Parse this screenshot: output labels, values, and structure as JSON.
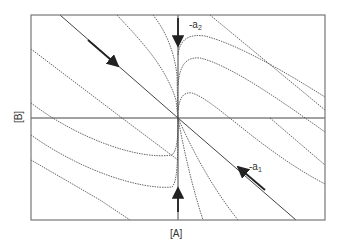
{
  "diagram": {
    "type": "phase-plane",
    "xlabel": "[A]",
    "ylabel": "[B]",
    "eigen_labels": [
      {
        "id": "a2",
        "prefix": "-a",
        "sub": "2"
      },
      {
        "id": "a1",
        "prefix": "-a",
        "sub": "1"
      }
    ],
    "colors": {
      "frame": "#777777",
      "curve": "#555555",
      "arrow": "#222222",
      "background": "#ffffff"
    },
    "frame": {
      "left": 31,
      "top": 15,
      "right": 325,
      "bottom": 220
    },
    "origin": {
      "x": 178,
      "y": 118
    },
    "trajectories": [
      {
        "name": "main-diagonal",
        "d": "M60,15 L178,118 L296,220",
        "style": "solid"
      },
      {
        "name": "upper-left-1",
        "d": "M117,15 C140,40 165,65 176,100 L178,118",
        "style": "dotted"
      },
      {
        "name": "upper-left-2",
        "d": "M153,15 C165,30 174,50 177,75 L178,118",
        "style": "dotted"
      },
      {
        "name": "left-1",
        "d": "M31,49 L122,118 L178,160",
        "style": "dotted"
      },
      {
        "name": "left-2",
        "d": "M31,103 C80,140 140,160 172,155 C177,150 178,140 178,118",
        "style": "dotted"
      },
      {
        "name": "left-3",
        "d": "M31,135 C80,170 140,190 172,187 C177,182 178,165 178,118",
        "style": "dotted"
      },
      {
        "name": "left-4",
        "d": "M31,160 L100,200 L130,220",
        "style": "dotted"
      },
      {
        "name": "upper-right-1",
        "d": "M178,55 C180,38 190,34 205,36 C240,45 290,75 325,97",
        "style": "dotted"
      },
      {
        "name": "upper-right-2",
        "d": "M178,85 C180,62 188,57 200,58 C230,65 280,100 325,132",
        "style": "dotted"
      },
      {
        "name": "upper-right-3",
        "d": "M178,110 C180,95 185,92 192,93 C215,100 260,150 325,184",
        "style": "dotted"
      },
      {
        "name": "lower-right-1",
        "d": "M178,118 C182,140 190,180 203,220",
        "style": "dotted"
      },
      {
        "name": "lower-right-2",
        "d": "M178,118 C190,145 210,185 238,220",
        "style": "dotted"
      },
      {
        "name": "upper-right-line",
        "d": "M210,15 L325,110",
        "style": "dotted"
      },
      {
        "name": "right-line",
        "d": "M270,118 L325,165",
        "style": "dotted"
      },
      {
        "name": "vertical-axis",
        "d": "M178,15 L178,220",
        "style": "solid"
      },
      {
        "name": "horizontal-axis",
        "d": "M31,118 L325,118",
        "style": "solid"
      }
    ],
    "arrows": [
      {
        "name": "arrow-diagonal-down",
        "x1": 88,
        "y1": 40,
        "x2": 118,
        "y2": 66
      },
      {
        "name": "arrow-a2-down",
        "x1": 178,
        "y1": 18,
        "x2": 178,
        "y2": 46
      },
      {
        "name": "arrow-a1-up",
        "x1": 265,
        "y1": 190,
        "x2": 238,
        "y2": 167
      },
      {
        "name": "arrow-bottom-up",
        "x1": 178,
        "y1": 212,
        "x2": 178,
        "y2": 188
      }
    ]
  }
}
